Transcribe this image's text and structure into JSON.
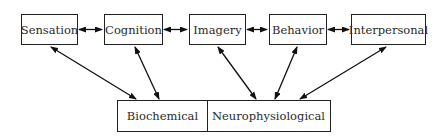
{
  "diagram": {
    "top_row": [
      {
        "id": "sensation",
        "label": "Sensation"
      },
      {
        "id": "cognition",
        "label": "Cognition"
      },
      {
        "id": "imagery",
        "label": "Imagery"
      },
      {
        "id": "behavior",
        "label": "Behavior"
      },
      {
        "id": "interpersonal",
        "label": "Interpersonal"
      }
    ],
    "bottom_row": [
      {
        "id": "biochemical",
        "label": "Biochemical"
      },
      {
        "id": "neurophysiological",
        "label": "Neurophysiological"
      }
    ],
    "edges": [
      {
        "from": "sensation",
        "to": "cognition",
        "type": "bidirectional"
      },
      {
        "from": "cognition",
        "to": "imagery",
        "type": "bidirectional"
      },
      {
        "from": "imagery",
        "to": "behavior",
        "type": "bidirectional"
      },
      {
        "from": "behavior",
        "to": "interpersonal",
        "type": "bidirectional"
      },
      {
        "from": "sensation",
        "to": "biochemical",
        "type": "bidirectional"
      },
      {
        "from": "cognition",
        "to": "biochemical",
        "type": "bidirectional"
      },
      {
        "from": "imagery",
        "to": "neurophysiological",
        "type": "bidirectional"
      },
      {
        "from": "behavior",
        "to": "neurophysiological",
        "type": "bidirectional"
      },
      {
        "from": "interpersonal",
        "to": "neurophysiological",
        "type": "bidirectional"
      }
    ]
  }
}
